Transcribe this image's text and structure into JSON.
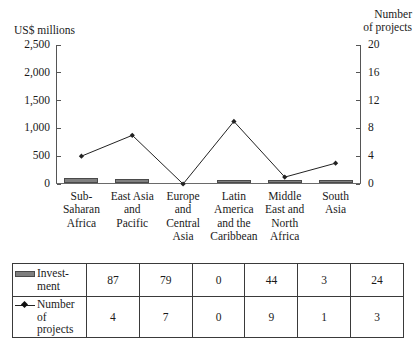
{
  "chart_data": {
    "type": "bar",
    "title": "",
    "subtitle": "",
    "categories": [
      "Sub-\nSaharan\nAfrica",
      "East Asia\nand\nPacific",
      "Europe\nand\nCentral\nAsia",
      "Latin\nAmerica\nand the\nCaribbean",
      "Middle\nEast and\nNorth\nAfrica",
      "South\nAsia"
    ],
    "series": [
      {
        "name": "Investment",
        "type": "bar",
        "axis": "left",
        "unit": "US$ millions",
        "values": [
          87,
          79,
          0,
          44,
          3,
          24
        ],
        "color": "#7f7f7f"
      },
      {
        "name": "Number of projects",
        "type": "line",
        "axis": "right",
        "unit": "projects",
        "values": [
          4,
          7,
          0,
          9,
          1,
          3
        ],
        "color": "#222222"
      }
    ],
    "left_axis": {
      "label": "US$ millions",
      "ticks": [
        "0",
        "500",
        "1,000",
        "1,500",
        "2,000",
        "2,500"
      ],
      "tick_values": [
        0,
        500,
        1000,
        1500,
        2000,
        2500
      ],
      "ylim": [
        0,
        2500
      ]
    },
    "right_axis": {
      "label": "Number of projects",
      "ticks": [
        "0",
        "4",
        "8",
        "12",
        "16",
        "20"
      ],
      "tick_values": [
        0,
        4,
        8,
        12,
        16,
        20
      ],
      "ylim": [
        0,
        20
      ]
    },
    "grid": false,
    "legend_position": "table-below"
  },
  "axis_titles": {
    "left": "US$ millions",
    "right": "Number\nof projects"
  },
  "table": {
    "rows": [
      {
        "legend_icon": "bar-swatch",
        "label": "Invest-\nment",
        "values": [
          "87",
          "79",
          "0",
          "44",
          "3",
          "24"
        ]
      },
      {
        "legend_icon": "line-marker-swatch",
        "label": "Number\nof projects",
        "values": [
          "4",
          "7",
          "0",
          "9",
          "1",
          "3"
        ]
      }
    ]
  }
}
